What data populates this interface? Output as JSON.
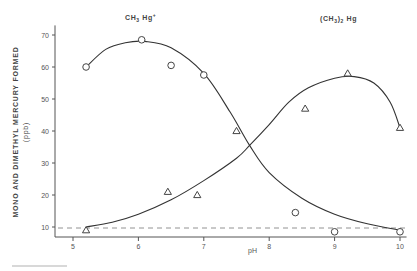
{
  "chart_data": {
    "type": "scatter",
    "title": "",
    "xlabel": "pH",
    "ylabel": "MONO AND DIMETHYL MERCURY FORMED",
    "ylabel_unit": "(ppb)",
    "xlim": [
      4.7,
      10.1
    ],
    "ylim": [
      7,
      73
    ],
    "x_ticks": [
      5,
      6,
      7,
      8,
      9,
      10
    ],
    "y_ticks": [
      10,
      20,
      30,
      40,
      50,
      60,
      70
    ],
    "grid": false,
    "legend_position": "inline-labels-top",
    "reference_line": {
      "y": 10,
      "style": "dashed"
    },
    "series": [
      {
        "name": "CH3 Hg+",
        "label_main": "CH",
        "label_sub": "3",
        "label_rest": " Hg",
        "label_sup": "+",
        "marker": "circle",
        "points": [
          {
            "x": 5.2,
            "y": 60
          },
          {
            "x": 6.05,
            "y": 68.5
          },
          {
            "x": 6.5,
            "y": 60.5
          },
          {
            "x": 7.0,
            "y": 57.5
          },
          {
            "x": 8.4,
            "y": 14.5
          },
          {
            "x": 9.0,
            "y": 8.5
          },
          {
            "x": 10.0,
            "y": 8.5
          }
        ],
        "fit_curve": [
          {
            "x": 5.2,
            "y": 60
          },
          {
            "x": 5.5,
            "y": 65.5
          },
          {
            "x": 5.8,
            "y": 67.6
          },
          {
            "x": 6.1,
            "y": 68
          },
          {
            "x": 6.5,
            "y": 66
          },
          {
            "x": 7.0,
            "y": 58
          },
          {
            "x": 7.4,
            "y": 46
          },
          {
            "x": 7.7,
            "y": 35.5
          },
          {
            "x": 8.0,
            "y": 27
          },
          {
            "x": 8.5,
            "y": 19
          },
          {
            "x": 9.0,
            "y": 14
          },
          {
            "x": 9.5,
            "y": 11
          },
          {
            "x": 10.0,
            "y": 9
          }
        ]
      },
      {
        "name": "(CH3)2 Hg",
        "label_main": "(CH",
        "label_sub": "3",
        "label_rest": ")",
        "label_sub2": "2",
        "label_tail": " Hg",
        "marker": "triangle",
        "points": [
          {
            "x": 5.2,
            "y": 9
          },
          {
            "x": 6.45,
            "y": 21
          },
          {
            "x": 6.9,
            "y": 20
          },
          {
            "x": 7.5,
            "y": 40
          },
          {
            "x": 8.55,
            "y": 47
          },
          {
            "x": 9.2,
            "y": 58
          },
          {
            "x": 10.0,
            "y": 41
          }
        ],
        "fit_curve": [
          {
            "x": 5.2,
            "y": 10
          },
          {
            "x": 5.6,
            "y": 11.5
          },
          {
            "x": 6.0,
            "y": 14
          },
          {
            "x": 6.5,
            "y": 18.5
          },
          {
            "x": 7.0,
            "y": 24.5
          },
          {
            "x": 7.5,
            "y": 31.5
          },
          {
            "x": 7.7,
            "y": 35.5
          },
          {
            "x": 8.0,
            "y": 42
          },
          {
            "x": 8.3,
            "y": 49
          },
          {
            "x": 8.6,
            "y": 53.5
          },
          {
            "x": 9.0,
            "y": 56.5
          },
          {
            "x": 9.3,
            "y": 57
          },
          {
            "x": 9.6,
            "y": 55
          },
          {
            "x": 9.85,
            "y": 49
          },
          {
            "x": 10.0,
            "y": 41
          }
        ]
      }
    ]
  },
  "labels": {
    "x_axis_title": "pH",
    "y_axis_title_line1": "MONO AND DIMETHYL MERCURY FORMED",
    "y_axis_title_line2": "(ppb)"
  }
}
